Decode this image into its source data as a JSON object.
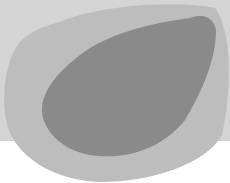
{
  "image": {
    "width": 230,
    "height": 183,
    "colors": {
      "page_background": "#ffffff",
      "background_band": "#d4d4d4",
      "outer_blob": "#bdbdbd",
      "inner_blob": "#8a8a8a"
    },
    "shapes": [
      "background-band",
      "outer-blob",
      "inner-blob"
    ]
  }
}
